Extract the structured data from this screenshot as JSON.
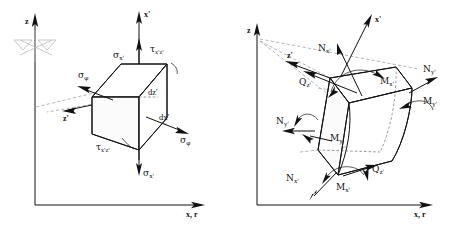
{
  "figure": {
    "title": "",
    "background_color": "#ffffff",
    "line_color": "#111111",
    "dashed_color": "#8c8c8c",
    "panels": [
      {
        "id": "left-panel",
        "name": "stress-element-panel",
        "description": "Differential shell element with stress components",
        "axes": {
          "vertical_label": "z",
          "horizontal_label": "x, r",
          "local_vertical_label": "x'",
          "local_depth_label": "z'"
        },
        "dimension_labels": [
          {
            "name": "dz-prime",
            "text": "dz'"
          },
          {
            "name": "dx-prime",
            "text": "dx'"
          }
        ],
        "stress_labels": [
          {
            "name": "sigma-x-prime-top",
            "symbol": "σ",
            "sub": "x'"
          },
          {
            "name": "sigma-x-prime-bottom",
            "symbol": "σ",
            "sub": "x'"
          },
          {
            "name": "tau-xz-prime-top",
            "symbol": "τ",
            "sub": "x'z'"
          },
          {
            "name": "tau-xz-prime-bottom",
            "symbol": "τ",
            "sub": "x'z'"
          },
          {
            "name": "sigma-phi-left",
            "symbol": "σ",
            "sub": "φ"
          },
          {
            "name": "sigma-phi-right",
            "symbol": "σ",
            "sub": "φ"
          }
        ],
        "symmetry_marker": {
          "name": "symmetry-axis-marker",
          "visible": true
        }
      },
      {
        "id": "right-panel",
        "name": "stress-resultant-panel",
        "description": "Differential shell element with internal force and moment resultants",
        "axes": {
          "vertical_label": "z",
          "horizontal_label": "x, r",
          "local_vertical_label": "x'",
          "local_depth_label": "z'"
        },
        "resultant_labels": [
          {
            "name": "n-x-prime-top",
            "symbol": "N",
            "sub": "x'"
          },
          {
            "name": "n-x-prime-bottom",
            "symbol": "N",
            "sub": "x'"
          },
          {
            "name": "n-y-prime-left",
            "symbol": "N",
            "sub": "y'"
          },
          {
            "name": "n-y-prime-right",
            "symbol": "N",
            "sub": "y'"
          },
          {
            "name": "q-z-prime-top",
            "symbol": "Q",
            "sub": "z'"
          },
          {
            "name": "q-z-prime-bottom",
            "symbol": "Q",
            "sub": "z'"
          },
          {
            "name": "m-x-prime-top",
            "symbol": "M",
            "sub": "x'"
          },
          {
            "name": "m-x-prime-bottom",
            "symbol": "M",
            "sub": "x'"
          },
          {
            "name": "m-y-prime-left",
            "symbol": "M",
            "sub": "y'"
          },
          {
            "name": "m-y-prime-right",
            "symbol": "M",
            "sub": "y'"
          }
        ]
      }
    ]
  },
  "labels": {
    "z": "z",
    "x_r": "x, r",
    "x_prime": "x'",
    "z_prime": "z'",
    "dz_prime": "dz'",
    "dx_prime": "dx'",
    "sigma": "σ",
    "tau": "τ",
    "phi": "φ",
    "sub_x_prime": "x'",
    "sub_xz_prime": "x'z'",
    "sub_y_prime": "y'",
    "sub_z_prime": "z'",
    "N": "N",
    "Q": "Q",
    "M": "M"
  }
}
